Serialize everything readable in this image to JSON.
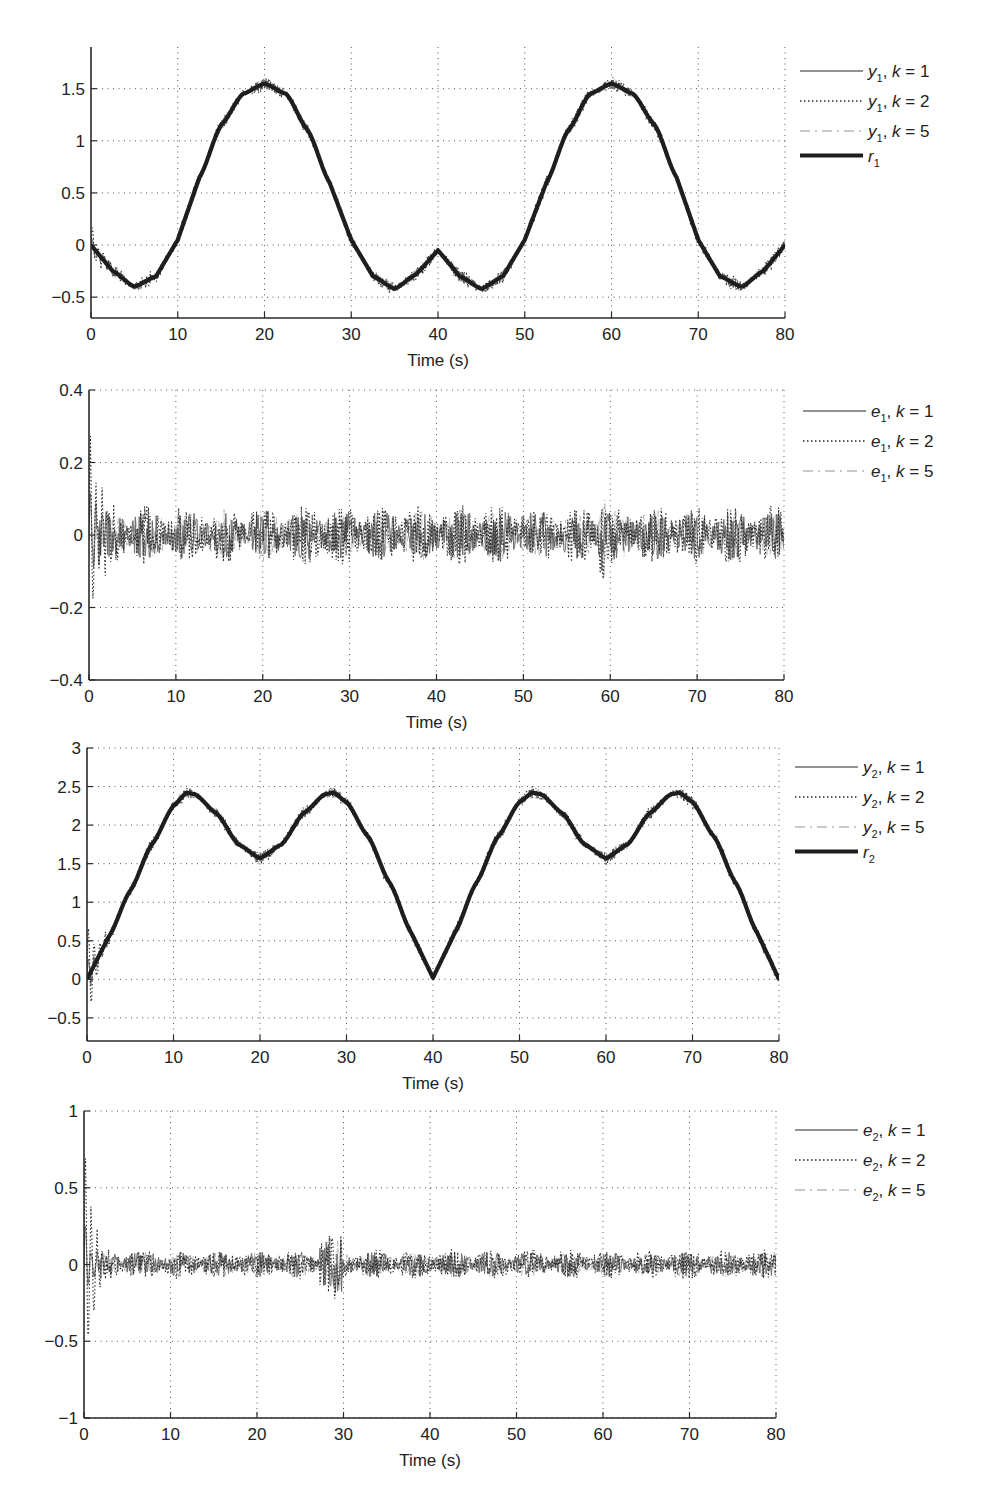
{
  "chart_data": [
    {
      "type": "line",
      "id": "p1",
      "title": "",
      "xlabel": "Time (s)",
      "ylabel": "",
      "xlim": [
        0,
        80
      ],
      "ylim": [
        -0.7,
        1.9
      ],
      "grid": true,
      "legend_position": "right-top",
      "x_ticks": [
        0,
        10,
        20,
        30,
        40,
        50,
        60,
        70,
        80
      ],
      "x_tick_labels": [
        "0",
        "10",
        "20",
        "30",
        "40",
        "50",
        "60",
        "70",
        "80"
      ],
      "y_ticks": [
        -0.5,
        0,
        0.5,
        1,
        1.5
      ],
      "y_tick_labels": [
        "−0.5",
        "0",
        "0.5",
        "1",
        "1.5"
      ],
      "reference": {
        "name": "r₁",
        "x": [
          0,
          2.5,
          5,
          7.5,
          10,
          12.5,
          15,
          17.5,
          20,
          22.5,
          25,
          27.5,
          30,
          32.5,
          35,
          37.5,
          40,
          42.5,
          45,
          47.5,
          50,
          52.5,
          55,
          57.5,
          60,
          62.5,
          65,
          67.5,
          70,
          72.5,
          75,
          77.5,
          80
        ],
        "values": [
          0,
          -0.25,
          -0.4,
          -0.3,
          0.05,
          0.65,
          1.15,
          1.45,
          1.55,
          1.45,
          1.1,
          0.6,
          0.05,
          -0.3,
          -0.42,
          -0.28,
          -0.05,
          -0.3,
          -0.42,
          -0.3,
          0.05,
          0.6,
          1.1,
          1.45,
          1.55,
          1.45,
          1.15,
          0.65,
          0.05,
          -0.3,
          -0.4,
          -0.25,
          0
        ]
      },
      "series": [
        {
          "name": "y1, k = 1",
          "var": "y",
          "sub": "1",
          "k": "1",
          "style": "solid",
          "noise_amp": 0.04,
          "transient_amp": 0.1
        },
        {
          "name": "y1, k = 2",
          "var": "y",
          "sub": "1",
          "k": "2",
          "style": "dotted",
          "noise_amp": 0.05,
          "transient_amp": 0.25
        },
        {
          "name": "y1, k = 5",
          "var": "y",
          "sub": "1",
          "k": "5",
          "style": "dashdot",
          "noise_amp": 0.04,
          "transient_amp": 0.08
        },
        {
          "name": "r1",
          "var": "r",
          "sub": "1",
          "style": "thick"
        }
      ]
    },
    {
      "type": "line",
      "id": "p2",
      "title": "",
      "xlabel": "Time (s)",
      "ylabel": "",
      "xlim": [
        0,
        80
      ],
      "ylim": [
        -0.4,
        0.4
      ],
      "grid": true,
      "legend_position": "right-top",
      "x_ticks": [
        0,
        10,
        20,
        30,
        40,
        50,
        60,
        70,
        80
      ],
      "x_tick_labels": [
        "0",
        "10",
        "20",
        "30",
        "40",
        "50",
        "60",
        "70",
        "80"
      ],
      "y_ticks": [
        -0.4,
        -0.2,
        0,
        0.2,
        0.4
      ],
      "y_tick_labels": [
        "−0.4",
        "−0.2",
        "0",
        "0.2",
        "0.4"
      ],
      "summary": {
        "steady_band": [
          -0.15,
          0.15
        ],
        "initial_peak": 0.32,
        "initial_trough": -0.32,
        "notable_spike_t": 59,
        "notable_spike_value": 0.15
      },
      "series": [
        {
          "name": "e1, k = 1",
          "var": "e",
          "sub": "1",
          "k": "1",
          "style": "solid",
          "noise_amp": 0.05,
          "transient_amp": 0.12
        },
        {
          "name": "e1, k = 2",
          "var": "e",
          "sub": "1",
          "k": "2",
          "style": "dotted",
          "noise_amp": 0.06,
          "transient_amp": 0.32
        },
        {
          "name": "e1, k = 5",
          "var": "e",
          "sub": "1",
          "k": "5",
          "style": "dashdot",
          "noise_amp": 0.05,
          "transient_amp": 0.1
        }
      ]
    },
    {
      "type": "line",
      "id": "p3",
      "title": "",
      "xlabel": "Time (s)",
      "ylabel": "",
      "xlim": [
        0,
        80
      ],
      "ylim": [
        -0.8,
        3
      ],
      "grid": true,
      "legend_position": "right-top",
      "x_ticks": [
        0,
        10,
        20,
        30,
        40,
        50,
        60,
        70,
        80
      ],
      "x_tick_labels": [
        "0",
        "10",
        "20",
        "30",
        "40",
        "50",
        "60",
        "70",
        "80"
      ],
      "y_ticks": [
        -0.5,
        0,
        0.5,
        1,
        1.5,
        2,
        2.5,
        3
      ],
      "y_tick_labels": [
        "−0.5",
        "0",
        "0.5",
        "1",
        "1.5",
        "2",
        "2.5",
        "3"
      ],
      "reference": {
        "name": "r₂",
        "x": [
          0,
          2.5,
          5,
          7.5,
          10,
          11.5,
          12.5,
          15,
          17.5,
          20,
          22.5,
          25,
          27.5,
          28.5,
          30,
          32.5,
          35,
          37.5,
          40,
          42.5,
          45,
          47.5,
          50,
          51.5,
          52.5,
          55,
          57.5,
          60,
          62.5,
          65,
          67.5,
          68.5,
          70,
          72.5,
          75,
          77.5,
          80
        ],
        "values": [
          0,
          0.55,
          1.15,
          1.75,
          2.25,
          2.42,
          2.4,
          2.15,
          1.75,
          1.57,
          1.75,
          2.15,
          2.4,
          2.42,
          2.3,
          1.85,
          1.25,
          0.6,
          0.02,
          0.6,
          1.25,
          1.85,
          2.3,
          2.42,
          2.4,
          2.15,
          1.75,
          1.57,
          1.75,
          2.15,
          2.4,
          2.42,
          2.3,
          1.85,
          1.25,
          0.6,
          0
        ]
      },
      "series": [
        {
          "name": "y2, k = 1",
          "var": "y",
          "sub": "2",
          "k": "1",
          "style": "solid",
          "noise_amp": 0.05,
          "transient_amp": 0.3
        },
        {
          "name": "y2, k = 2",
          "var": "y",
          "sub": "2",
          "k": "2",
          "style": "dotted",
          "noise_amp": 0.06,
          "transient_amp": 0.8
        },
        {
          "name": "y2, k = 5",
          "var": "y",
          "sub": "2",
          "k": "5",
          "style": "dashdot",
          "noise_amp": 0.05,
          "transient_amp": 0.25
        },
        {
          "name": "r2",
          "var": "r",
          "sub": "2",
          "style": "thick"
        }
      ]
    },
    {
      "type": "line",
      "id": "p4",
      "title": "",
      "xlabel": "Time (s)",
      "ylabel": "",
      "xlim": [
        0,
        80
      ],
      "ylim": [
        -1,
        1
      ],
      "grid": true,
      "legend_position": "right-top",
      "x_ticks": [
        0,
        10,
        20,
        30,
        40,
        50,
        60,
        70,
        80
      ],
      "x_tick_labels": [
        "0",
        "10",
        "20",
        "30",
        "40",
        "50",
        "60",
        "70",
        "80"
      ],
      "y_ticks": [
        -1,
        -0.5,
        0,
        0.5,
        1
      ],
      "y_tick_labels": [
        "−1",
        "−0.5",
        "0",
        "0.5",
        "1"
      ],
      "summary": {
        "steady_band": [
          -0.2,
          0.2
        ],
        "initial_peak": 0.88,
        "initial_trough": -0.78,
        "notable_burst_t": 28.5,
        "notable_burst_amp": 0.22
      },
      "series": [
        {
          "name": "e2, k = 1",
          "var": "e",
          "sub": "2",
          "k": "1",
          "style": "solid",
          "noise_amp": 0.06,
          "transient_amp": 0.3
        },
        {
          "name": "e2, k = 2",
          "var": "e",
          "sub": "2",
          "k": "2",
          "style": "dotted",
          "noise_amp": 0.07,
          "transient_amp": 0.85
        },
        {
          "name": "e2, k = 5",
          "var": "e",
          "sub": "2",
          "k": "5",
          "style": "dashdot",
          "noise_amp": 0.06,
          "transient_amp": 0.25
        }
      ]
    }
  ],
  "colors": {
    "axis": "#2a2a2a",
    "grid": "#555555",
    "reference": "#1e1e1e",
    "k1": "#6f6f6f",
    "k2": "#2b2b2b",
    "k5": "#b8b8b8",
    "text": "#222222"
  }
}
